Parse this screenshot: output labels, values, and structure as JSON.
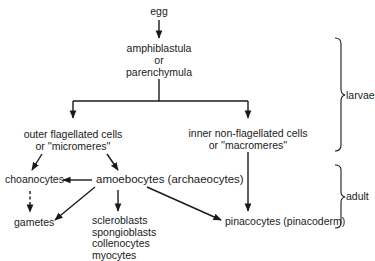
{
  "diagram": {
    "nodes": {
      "egg": "egg",
      "larva_1": "amphiblastula",
      "larva_or": "or",
      "larva_2": "parenchymula",
      "outer_1": "outer flagellated cells",
      "outer_2": "or ''micromeres''",
      "inner_1": "inner non-flagellated cells",
      "inner_2": "or ''macromeres''",
      "choanocytes": "choanocytes",
      "amoebocytes": "amoebocytes (archaeocytes)",
      "gametes": "gametes",
      "derived_1": "scleroblasts",
      "derived_2": "spongioblasts",
      "derived_3": "collenocytes",
      "derived_4": "myocytes",
      "pinacocytes": "pinacocytes (pinacoderm)"
    },
    "stages": {
      "larvae": "larvae",
      "adult": "adult"
    },
    "edges": [
      {
        "from": "egg",
        "to": "larva",
        "style": "solid"
      },
      {
        "from": "larva",
        "to": "outer",
        "style": "solid"
      },
      {
        "from": "larva",
        "to": "inner",
        "style": "solid"
      },
      {
        "from": "outer",
        "to": "choanocytes",
        "style": "solid"
      },
      {
        "from": "outer",
        "to": "amoebocytes",
        "style": "solid"
      },
      {
        "from": "amoebocytes",
        "to": "choanocytes",
        "style": "solid"
      },
      {
        "from": "amoebocytes",
        "to": "gametes",
        "style": "solid"
      },
      {
        "from": "amoebocytes",
        "to": "derived",
        "style": "solid"
      },
      {
        "from": "amoebocytes",
        "to": "pinacocytes",
        "style": "solid"
      },
      {
        "from": "inner",
        "to": "pinacocytes",
        "style": "solid"
      },
      {
        "from": "choanocytes",
        "to": "gametes",
        "style": "dashed"
      }
    ]
  }
}
